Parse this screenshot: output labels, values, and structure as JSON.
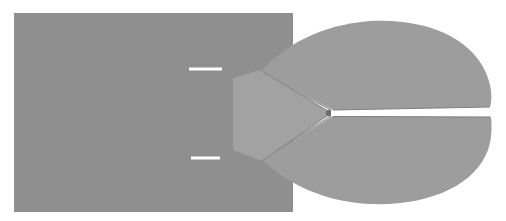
{
  "figure": {
    "width": 506,
    "height": 221,
    "background": "#ffffff",
    "colors": {
      "base_plate": "#8f8f8f",
      "lobes": "#9d9d9d",
      "wedge": "#a2a2a2",
      "wedge_shadow": "#7a7a7a",
      "marks": "#ffffff",
      "slit": "#ffffff"
    },
    "base_plate": {
      "x": 14,
      "y": 13,
      "w": 279,
      "h": 199
    },
    "marks": [
      {
        "x1": 189,
        "y1": 69,
        "x2": 222,
        "y2": 69
      },
      {
        "x1": 191,
        "y1": 158,
        "x2": 220,
        "y2": 158
      }
    ],
    "slit": {
      "apex_x": 331,
      "apex_y": 113,
      "end_x": 491,
      "top_y": 108,
      "bottom_y": 117
    }
  }
}
